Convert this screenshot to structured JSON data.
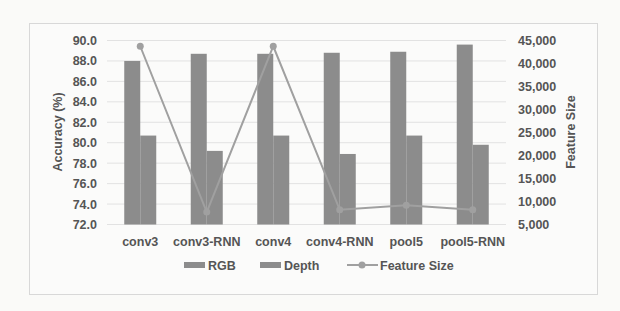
{
  "chart_data": {
    "type": "bar",
    "title": "",
    "categories": [
      "conv3",
      "conv3-RNN",
      "conv4",
      "conv4-RNN",
      "pool5",
      "pool5-RNN"
    ],
    "series": [
      {
        "name": "RGB",
        "type": "bar",
        "axis": "left",
        "values": [
          88.0,
          88.7,
          88.7,
          88.8,
          88.9,
          89.6
        ]
      },
      {
        "name": "Depth",
        "type": "bar",
        "axis": "left",
        "values": [
          80.7,
          79.2,
          80.7,
          78.9,
          80.7,
          79.8
        ]
      },
      {
        "name": "Feature Size",
        "type": "line",
        "axis": "right",
        "values": [
          43750,
          7700,
          43750,
          8200,
          9200,
          8200
        ]
      }
    ],
    "xlabel": "",
    "ylabel": "Accuracy (%)",
    "ylabel_right": "Feature Size",
    "ylim": [
      72.0,
      90.0
    ],
    "ylim_right": [
      5000,
      45000
    ],
    "yticks": [
      "72.0",
      "74.0",
      "76.0",
      "78.0",
      "80.0",
      "82.0",
      "84.0",
      "86.0",
      "88.0",
      "90.0"
    ],
    "yticks_right": [
      "5,000",
      "10,000",
      "15,000",
      "20,000",
      "25,000",
      "30,000",
      "35,000",
      "40,000",
      "45,000"
    ],
    "grid": true,
    "legend_position": "bottom",
    "legend": [
      "RGB",
      "Depth",
      "Feature Size"
    ]
  },
  "colors": {
    "rgb": "#8c8c8c",
    "depth": "#8c8c8c",
    "line": "#a0a0a0",
    "grid": "#e2e2e2",
    "text": "#555555"
  }
}
